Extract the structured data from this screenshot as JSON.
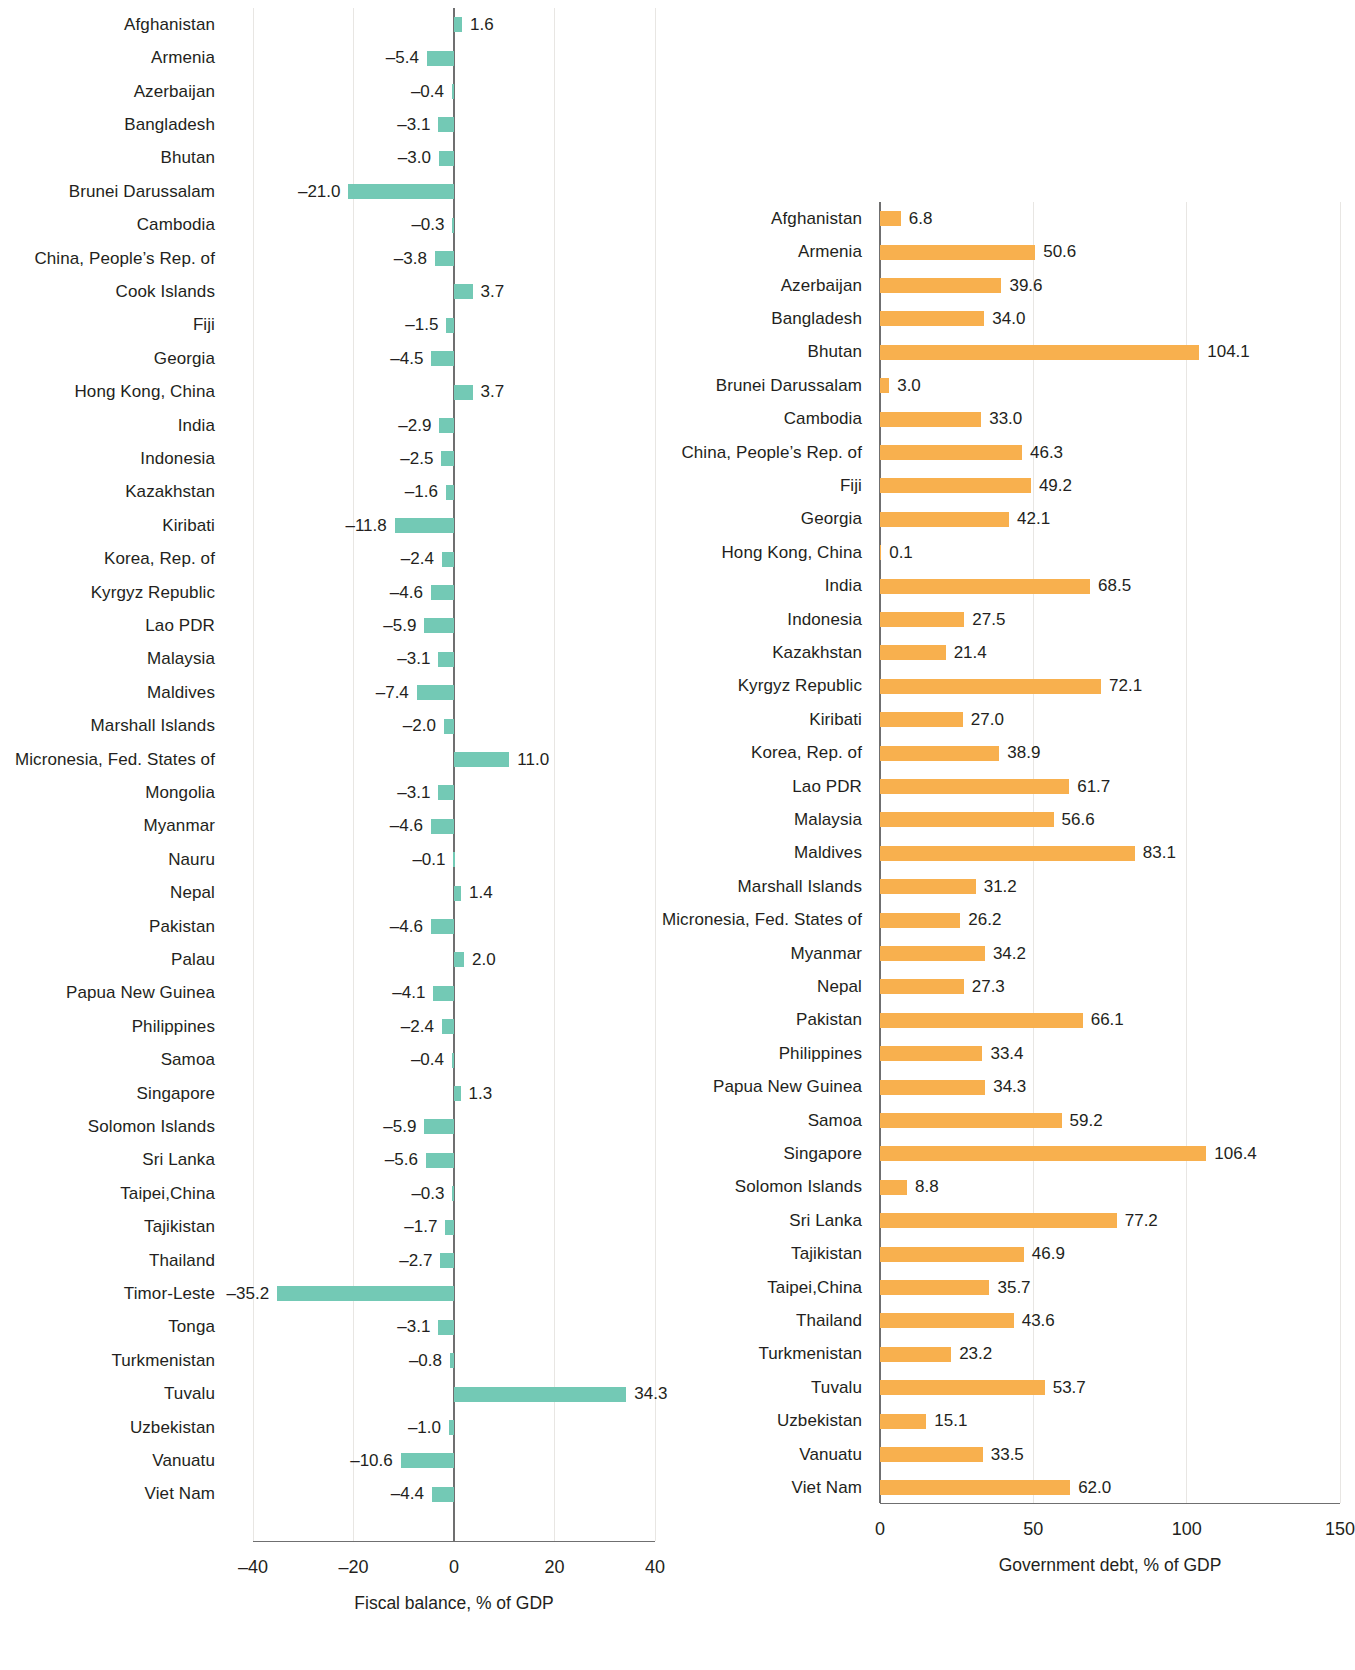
{
  "chart_data": [
    {
      "type": "bar",
      "orientation": "horizontal",
      "id": "fiscal-balance",
      "title": "",
      "xlabel": "Fiscal balance, % of GDP",
      "ylabel": "",
      "xlim": [
        -40,
        40
      ],
      "xticks": [
        -40,
        -20,
        0,
        20,
        40
      ],
      "xtick_labels": [
        "–40",
        "–20",
        "0",
        "20",
        "40"
      ],
      "grid": true,
      "legend": "none",
      "bar_color": "#73c9b5",
      "categories": [
        "Afghanistan",
        "Armenia",
        "Azerbaijan",
        "Bangladesh",
        "Bhutan",
        "Brunei Darussalam",
        "Cambodia",
        "China, People’s Rep. of",
        "Cook Islands",
        "Fiji",
        "Georgia",
        "Hong Kong, China",
        "India",
        "Indonesia",
        "Kazakhstan",
        "Kiribati",
        "Korea, Rep. of",
        "Kyrgyz Republic",
        "Lao PDR",
        "Malaysia",
        "Maldives",
        "Marshall Islands",
        "Micronesia, Fed. States of",
        "Mongolia",
        "Myanmar",
        "Nauru",
        "Nepal",
        "Pakistan",
        "Palau",
        "Papua New Guinea",
        "Philippines",
        "Samoa",
        "Singapore",
        "Solomon Islands",
        "Sri Lanka",
        "Taipei,China",
        "Tajikistan",
        "Thailand",
        "Timor-Leste",
        "Tonga",
        "Turkmenistan",
        "Tuvalu",
        "Uzbekistan",
        "Vanuatu",
        "Viet Nam"
      ],
      "values": [
        1.6,
        -5.4,
        -0.4,
        -3.1,
        -3.0,
        -21.0,
        -0.3,
        -3.8,
        3.7,
        -1.5,
        -4.5,
        3.7,
        -2.9,
        -2.5,
        -1.6,
        -11.8,
        -2.4,
        -4.6,
        -5.9,
        -3.1,
        -7.4,
        -2.0,
        11.0,
        -3.1,
        -4.6,
        -0.1,
        1.4,
        -4.6,
        2.0,
        -4.1,
        -2.4,
        -0.4,
        1.3,
        -5.9,
        -5.6,
        -0.3,
        -1.7,
        -2.7,
        -35.2,
        -3.1,
        -0.8,
        34.3,
        -1.0,
        -10.6,
        -4.4
      ],
      "value_labels": [
        "1.6",
        "–5.4",
        "–0.4",
        "–3.1",
        "–3.0",
        "–21.0",
        "–0.3",
        "–3.8",
        "3.7",
        "–1.5",
        "–4.5",
        "3.7",
        "–2.9",
        "–2.5",
        "–1.6",
        "–11.8",
        "–2.4",
        "–4.6",
        "–5.9",
        "–3.1",
        "–7.4",
        "–2.0",
        "11.0",
        "–3.1",
        "–4.6",
        "–0.1",
        "1.4",
        "–4.6",
        "2.0",
        "–4.1",
        "–2.4",
        "–0.4",
        "1.3",
        "–5.9",
        "–5.6",
        "–0.3",
        "–1.7",
        "–2.7",
        "–35.2",
        "–3.1",
        "–0.8",
        "34.3",
        "–1.0",
        "–10.6",
        "–4.4"
      ]
    },
    {
      "type": "bar",
      "orientation": "horizontal",
      "id": "government-debt",
      "title": "",
      "xlabel": "Government debt, % of GDP",
      "ylabel": "",
      "xlim": [
        0,
        150
      ],
      "xticks": [
        0,
        50,
        100,
        150
      ],
      "xtick_labels": [
        "0",
        "50",
        "100",
        "150"
      ],
      "grid": true,
      "legend": "none",
      "bar_color": "#f8b04e",
      "categories": [
        "Afghanistan",
        "Armenia",
        "Azerbaijan",
        "Bangladesh",
        "Bhutan",
        "Brunei Darussalam",
        "Cambodia",
        "China, People’s Rep. of",
        "Fiji",
        "Georgia",
        "Hong Kong, China",
        "India",
        "Indonesia",
        "Kazakhstan",
        "Kyrgyz Republic",
        "Kiribati",
        "Korea, Rep. of",
        "Lao PDR",
        "Malaysia",
        "Maldives",
        "Marshall Islands",
        "Micronesia, Fed. States of",
        "Myanmar",
        "Nepal",
        "Pakistan",
        "Philippines",
        "Papua New Guinea",
        "Samoa",
        "Singapore",
        "Solomon Islands",
        "Sri Lanka",
        "Tajikistan",
        "Taipei,China",
        "Thailand",
        "Turkmenistan",
        "Tuvalu",
        "Uzbekistan",
        "Vanuatu",
        "Viet Nam"
      ],
      "values": [
        6.8,
        50.6,
        39.6,
        34.0,
        104.1,
        3.0,
        33.0,
        46.3,
        49.2,
        42.1,
        0.1,
        68.5,
        27.5,
        21.4,
        72.1,
        27.0,
        38.9,
        61.7,
        56.6,
        83.1,
        31.2,
        26.2,
        34.2,
        27.3,
        66.1,
        33.4,
        34.3,
        59.2,
        106.4,
        8.8,
        77.2,
        46.9,
        35.7,
        43.6,
        23.2,
        53.7,
        15.1,
        33.5,
        62.0
      ],
      "value_labels": [
        "6.8",
        "50.6",
        "39.6",
        "34.0",
        "104.1",
        "3.0",
        "33.0",
        "46.3",
        "49.2",
        "42.1",
        "0.1",
        "68.5",
        "27.5",
        "21.4",
        "72.1",
        "27.0",
        "38.9",
        "61.7",
        "56.6",
        "83.1",
        "31.2",
        "26.2",
        "34.2",
        "27.3",
        "66.1",
        "33.4",
        "34.3",
        "59.2",
        "106.4",
        "8.8",
        "77.2",
        "46.9",
        "35.7",
        "43.6",
        "23.2",
        "53.7",
        "15.1",
        "33.5",
        "62.0"
      ]
    }
  ]
}
